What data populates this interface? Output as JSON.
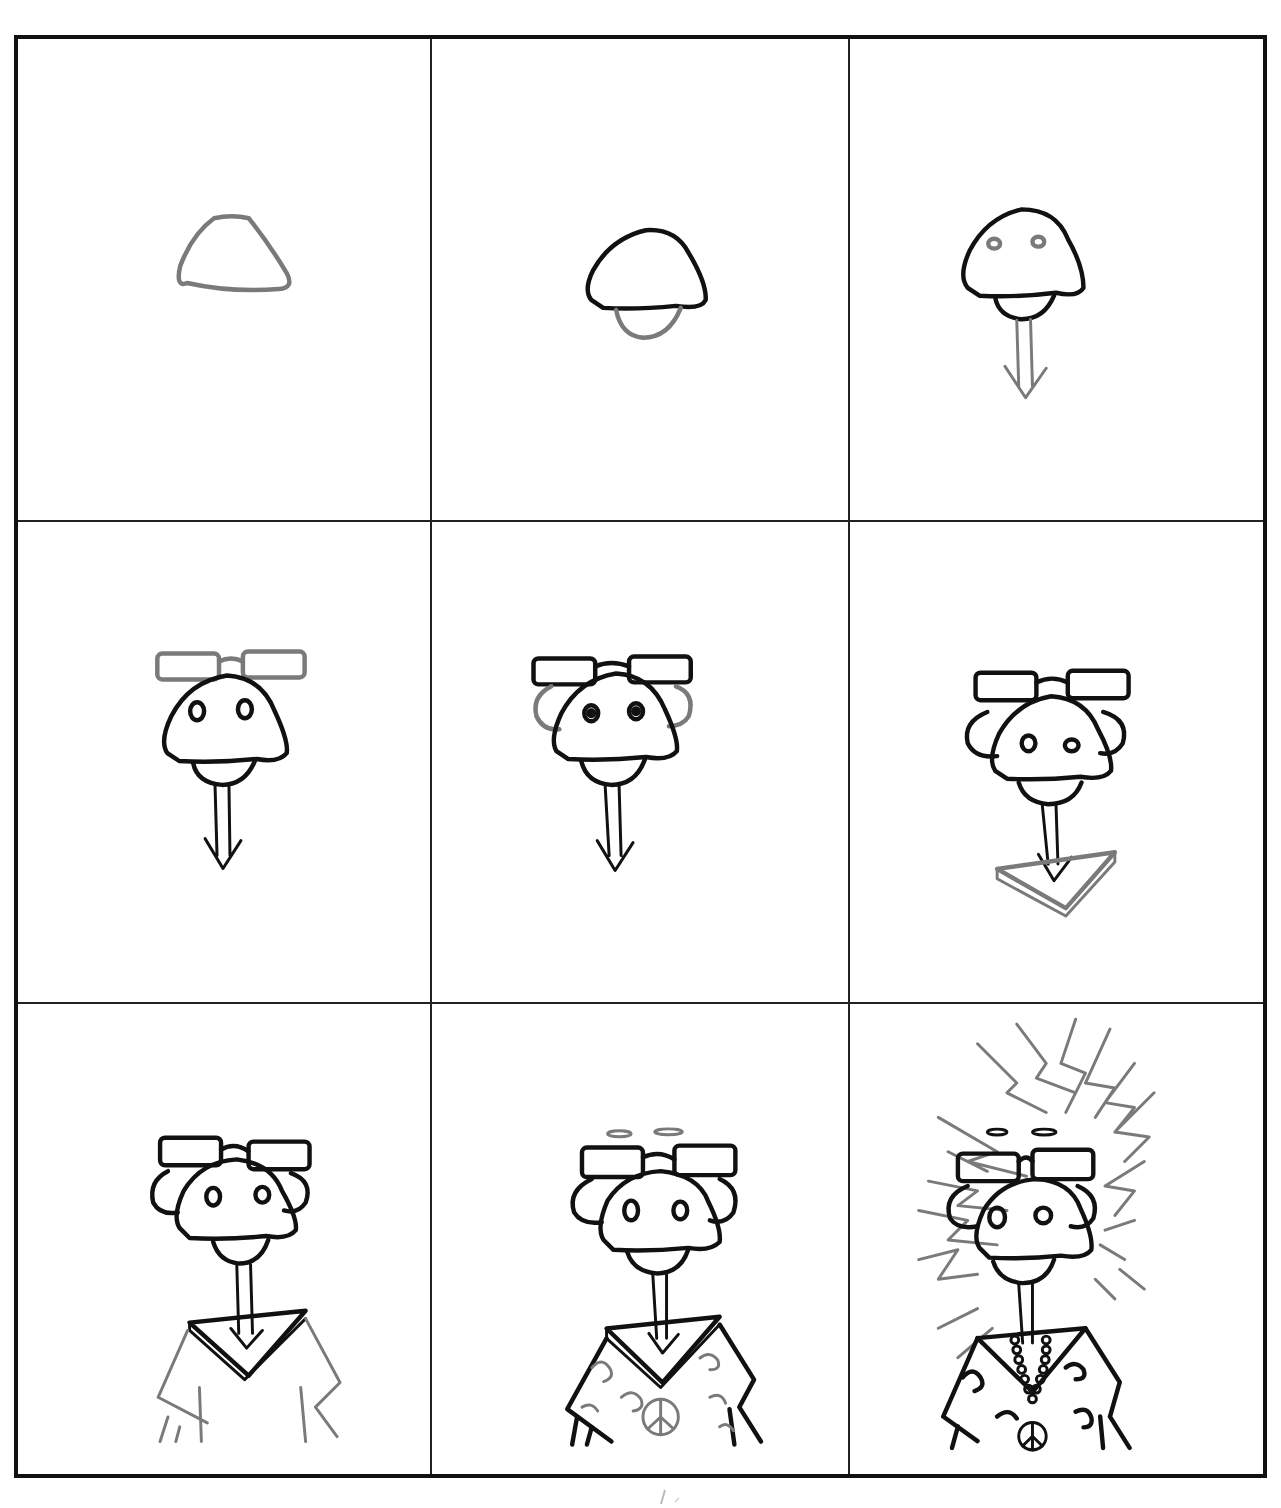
{
  "diagram": {
    "type": "step-by-step drawing tutorial",
    "layout": {
      "rows": 3,
      "columns": 3
    },
    "colors": {
      "existing_lines": "#111111",
      "new_step_lines": "#7a7a7a",
      "background": "#ffffff",
      "frame": "#111111"
    },
    "panels": [
      {
        "step": 1,
        "adds": "head dome outline"
      },
      {
        "step": 2,
        "adds": "chin under head"
      },
      {
        "step": 3,
        "adds": "nostrils and arrow-shaped neck"
      },
      {
        "step": 4,
        "adds": "glasses on top of head"
      },
      {
        "step": 5,
        "adds": "ears behind head"
      },
      {
        "step": 6,
        "adds": "triangular collar"
      },
      {
        "step": 7,
        "adds": "shirt body and sleeves"
      },
      {
        "step": 8,
        "adds": "shirt pattern, peace sign, eyebrows"
      },
      {
        "step": 9,
        "adds": "spiky hair and bead necklace"
      }
    ]
  }
}
